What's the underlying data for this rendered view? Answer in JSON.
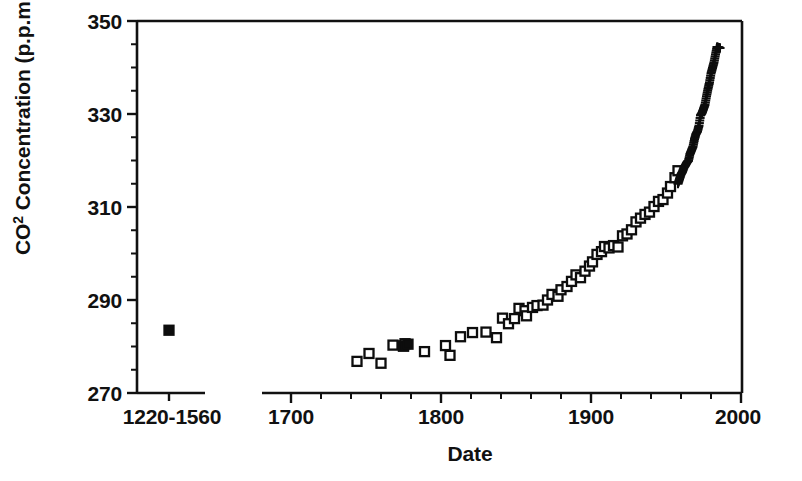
{
  "chart_data": {
    "type": "scatter",
    "title": "",
    "xlabel": "Date",
    "ylabel": "CO2 Concentration (p.p.m.)",
    "ylabel_prefix": "CO",
    "ylabel_superscript": "2",
    "ylabel_suffix": " Concentration (p.p.m.)",
    "ylim": [
      270,
      350
    ],
    "y_ticks_major": [
      270,
      290,
      310,
      330,
      350
    ],
    "y_ticks_minor": [
      275,
      280,
      285,
      295,
      300,
      305,
      315,
      320,
      325,
      335,
      340,
      345
    ],
    "y_tick_labels": [
      "270",
      "290",
      "310",
      "330",
      "350"
    ],
    "xlim": [
      1690,
      2000
    ],
    "x_ticks_major": [
      1700,
      1800,
      1900,
      2000
    ],
    "x_tick_labels": [
      "1700",
      "1800",
      "1900",
      "2000"
    ],
    "x_ticks_minor": [
      1720,
      1740,
      1760,
      1780,
      1820,
      1840,
      1860,
      1880,
      1920,
      1940,
      1960,
      1980
    ],
    "axis_break": true,
    "broken_segment_label": "1220-1560",
    "grid": false,
    "legend": "none",
    "marker_color": "#0d0d0d",
    "series": [
      {
        "name": "Ice core (medieval, 1220-1560)",
        "marker": "filled-square",
        "points": [
          {
            "label": "1220-1560",
            "y": 283.5
          }
        ]
      },
      {
        "name": "Ice core CO2 (Siple / Law Dome)",
        "marker": "open-square",
        "x": [
          1744,
          1752,
          1760,
          1768,
          1775,
          1776,
          1789,
          1803,
          1806,
          1813,
          1821,
          1830,
          1837,
          1841,
          1845,
          1849,
          1852,
          1856,
          1857,
          1861,
          1864,
          1868,
          1871,
          1874,
          1878,
          1880,
          1884,
          1887,
          1890,
          1893,
          1896,
          1899,
          1901,
          1904,
          1907,
          1909,
          1912,
          1915,
          1918,
          1921,
          1924,
          1927,
          1930,
          1933,
          1936,
          1939,
          1942,
          1945,
          1948,
          1951,
          1953,
          1956,
          1958
        ],
        "y": [
          276.8,
          278.5,
          276.4,
          280.3,
          280.1,
          280.6,
          278.9,
          280.2,
          278.1,
          282.1,
          283.0,
          283.1,
          281.9,
          286.1,
          284.9,
          286.0,
          288.2,
          287.7,
          286.6,
          288.4,
          288.8,
          288.9,
          290.0,
          291.2,
          290.8,
          292.2,
          292.9,
          294.0,
          295.4,
          294.8,
          296.2,
          297.3,
          298.2,
          299.8,
          300.4,
          301.5,
          301.2,
          301.7,
          301.4,
          303.8,
          304.2,
          305.1,
          306.8,
          307.6,
          308.4,
          308.9,
          310.1,
          311.2,
          311.6,
          313.0,
          314.4,
          316.3,
          317.8
        ]
      },
      {
        "name": "Mauna Loa atmospheric CO2",
        "marker": "plus",
        "x": [
          1958,
          1959,
          1960,
          1961,
          1962,
          1963,
          1964,
          1965,
          1966,
          1967,
          1968,
          1969,
          1970,
          1971,
          1972,
          1973,
          1974,
          1975,
          1976,
          1977,
          1978,
          1979,
          1980,
          1981,
          1982,
          1983,
          1984,
          1985,
          1986
        ],
        "y": [
          315.0,
          316.0,
          317.0,
          317.6,
          318.5,
          319.0,
          319.6,
          320.0,
          321.4,
          322.2,
          323.0,
          324.6,
          325.7,
          326.3,
          327.5,
          329.7,
          330.2,
          331.1,
          332.0,
          333.8,
          335.4,
          336.8,
          338.7,
          339.9,
          341.1,
          342.8,
          344.4,
          344.3,
          344.2
        ]
      }
    ]
  },
  "layout": {
    "plot_left_px": 137,
    "plot_right_px": 742,
    "plot_top_px": 21,
    "plot_bottom_px": 393,
    "break_axis_left_end_px": 205,
    "break_axis_right_start_px": 262,
    "break_point_x_px": 169,
    "px_per_year": 1.5,
    "year_origin": 1700,
    "year_origin_px": 291
  }
}
